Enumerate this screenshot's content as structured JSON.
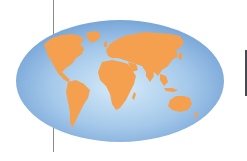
{
  "image": {
    "description": "World map in an elliptical projection with orange continents on a blue radial-gradient ocean",
    "colors": {
      "ocean_center": "#cfe6f7",
      "ocean_mid": "#9cc4e8",
      "ocean_edge": "#6f9ed4",
      "land": "#f5a04e",
      "land_shadow": "#e88d3c",
      "left_rule": "#8a8a8a",
      "right_bar": "#4a4a52"
    },
    "continents": [
      "North America",
      "Greenland",
      "South America",
      "Europe",
      "Africa",
      "Asia",
      "Australia"
    ]
  }
}
